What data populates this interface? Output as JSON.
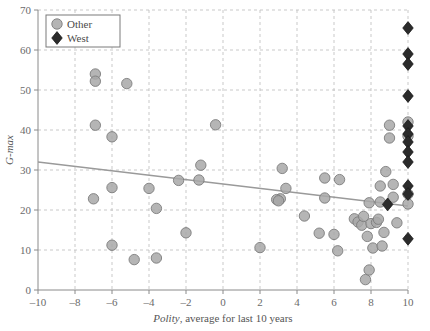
{
  "chart_data": {
    "type": "scatter",
    "title": "",
    "xlabel": "Polity, average for last 10 years",
    "xlabel_italic_part": "Polity",
    "xlabel_rest": ", average for last 10 years",
    "ylabel": "G-max",
    "xlim": [
      -10,
      10
    ],
    "ylim": [
      0,
      70
    ],
    "xticks": [
      -10,
      -8,
      -6,
      -4,
      -2,
      0,
      2,
      4,
      6,
      8,
      10
    ],
    "xtick_labels": [
      "–10",
      "–8",
      "–6",
      "–4",
      "–2",
      "0",
      "2",
      "4",
      "6",
      "8",
      "10"
    ],
    "yticks": [
      0,
      10,
      20,
      30,
      40,
      50,
      60,
      70
    ],
    "ytick_labels": [
      "0",
      "10",
      "20",
      "30",
      "40",
      "50",
      "60",
      "70"
    ],
    "grid": true,
    "grid_style": "dashed",
    "grid_color": "#bbbbbb",
    "legend_position": "top-left",
    "legend": [
      {
        "label": "Other",
        "marker": "circle",
        "color": "#a8a8a8",
        "edge": "#7d7d7d"
      },
      {
        "label": "West",
        "marker": "diamond",
        "color": "#2b2b2b",
        "edge": "#1a1a1a"
      }
    ],
    "trendline": {
      "x": [
        -10,
        10
      ],
      "y": [
        32.0,
        21.0
      ],
      "color": "#9a9a9a",
      "width": 1.4
    },
    "series": [
      {
        "name": "Other",
        "marker": "circle",
        "color": "#a8a8a8",
        "edge": "#7d7d7d",
        "points": [
          [
            -6.9,
            54.0
          ],
          [
            -6.9,
            52.2
          ],
          [
            -5.2,
            51.6
          ],
          [
            -6.9,
            41.2
          ],
          [
            -6.0,
            38.3
          ],
          [
            -7.0,
            22.8
          ],
          [
            -6.0,
            25.6
          ],
          [
            -6.0,
            11.2
          ],
          [
            -4.8,
            7.6
          ],
          [
            -4.0,
            25.4
          ],
          [
            -3.6,
            20.4
          ],
          [
            -3.6,
            8.0
          ],
          [
            -2.4,
            27.4
          ],
          [
            -2.0,
            14.3
          ],
          [
            -1.3,
            27.5
          ],
          [
            -1.2,
            31.2
          ],
          [
            -0.4,
            41.3
          ],
          [
            2.0,
            10.6
          ],
          [
            3.4,
            25.4
          ],
          [
            3.1,
            22.8
          ],
          [
            2.9,
            22.6
          ],
          [
            3.0,
            22.3
          ],
          [
            3.2,
            30.4
          ],
          [
            4.4,
            18.5
          ],
          [
            5.2,
            14.2
          ],
          [
            5.5,
            28.0
          ],
          [
            5.5,
            23.0
          ],
          [
            6.0,
            13.9
          ],
          [
            6.3,
            27.6
          ],
          [
            6.2,
            9.8
          ],
          [
            7.1,
            17.8
          ],
          [
            7.3,
            17.0
          ],
          [
            7.5,
            16.2
          ],
          [
            7.6,
            18.4
          ],
          [
            7.8,
            13.4
          ],
          [
            7.7,
            2.6
          ],
          [
            7.9,
            5.0
          ],
          [
            7.9,
            21.8
          ],
          [
            8.0,
            16.6
          ],
          [
            8.1,
            10.5
          ],
          [
            8.3,
            16.9
          ],
          [
            8.4,
            17.7
          ],
          [
            8.5,
            22.0
          ],
          [
            8.5,
            26.0
          ],
          [
            8.6,
            11.0
          ],
          [
            8.7,
            14.4
          ],
          [
            8.8,
            29.6
          ],
          [
            9.0,
            38.0
          ],
          [
            9.0,
            41.2
          ],
          [
            9.2,
            26.4
          ],
          [
            9.2,
            23.2
          ],
          [
            9.4,
            16.8
          ],
          [
            10.0,
            42.0
          ],
          [
            10.0,
            38.5
          ],
          [
            10.0,
            24.0
          ],
          [
            10.0,
            21.5
          ]
        ]
      },
      {
        "name": "West",
        "marker": "diamond",
        "color": "#2b2b2b",
        "edge": "#1a1a1a",
        "points": [
          [
            10.0,
            65.5
          ],
          [
            10.0,
            59.0
          ],
          [
            10.0,
            56.5
          ],
          [
            10.0,
            48.5
          ],
          [
            10.0,
            41.0
          ],
          [
            10.0,
            39.0
          ],
          [
            10.0,
            37.0
          ],
          [
            10.0,
            34.5
          ],
          [
            10.0,
            32.0
          ],
          [
            10.0,
            26.0
          ],
          [
            10.0,
            24.0
          ],
          [
            10.0,
            12.8
          ],
          [
            8.9,
            21.4
          ]
        ]
      }
    ]
  }
}
